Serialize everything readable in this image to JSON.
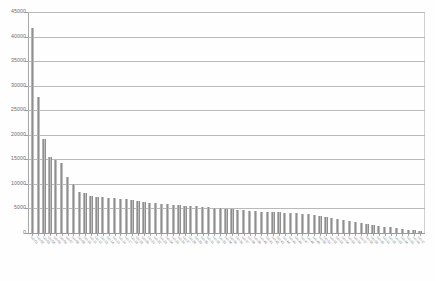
{
  "chart_data": {
    "type": "bar",
    "title": "",
    "xlabel": "",
    "ylabel": "",
    "ylim": [
      0,
      45000
    ],
    "ytick_step": 5000,
    "yticks": [
      0,
      5000,
      10000,
      15000,
      20000,
      25000,
      30000,
      35000,
      40000,
      45000
    ],
    "ytick_labels": [
      "0",
      "5000",
      "10000",
      "15000",
      "20000",
      "25000",
      "30000",
      "35000",
      "40000",
      "45000"
    ],
    "grid": true,
    "grid_axis": "y",
    "legend": false,
    "bar_color": "#8f8f8f",
    "gridline_color": "#b9b9b9",
    "axis_color": "#a8a8a8",
    "categories": [
      "cat-01",
      "cat-02",
      "cat-03",
      "cat-04",
      "cat-05",
      "cat-06",
      "cat-07",
      "cat-08",
      "cat-09",
      "cat-10",
      "cat-11",
      "cat-12",
      "cat-13",
      "cat-14",
      "cat-15",
      "cat-16",
      "cat-17",
      "cat-18",
      "cat-19",
      "cat-20",
      "cat-21",
      "cat-22",
      "cat-23",
      "cat-24",
      "cat-25",
      "cat-26",
      "cat-27",
      "cat-28",
      "cat-29",
      "cat-30",
      "cat-31",
      "cat-32",
      "cat-33",
      "cat-34",
      "cat-35",
      "cat-36",
      "cat-37",
      "cat-38",
      "cat-39",
      "cat-40",
      "cat-41",
      "cat-42",
      "cat-43",
      "cat-44",
      "cat-45",
      "cat-46",
      "cat-47",
      "cat-48",
      "cat-49",
      "cat-50",
      "cat-51",
      "cat-52",
      "cat-53",
      "cat-54",
      "cat-55",
      "cat-56",
      "cat-57",
      "cat-58",
      "cat-59",
      "cat-60",
      "cat-61",
      "cat-62",
      "cat-63",
      "cat-64",
      "cat-65",
      "cat-66",
      "cat-67"
    ],
    "values": [
      41800,
      27600,
      19100,
      15500,
      14900,
      14200,
      11400,
      10000,
      8300,
      8200,
      7500,
      7400,
      7300,
      7200,
      7100,
      7000,
      6900,
      6700,
      6500,
      6300,
      6200,
      6100,
      6000,
      5900,
      5800,
      5700,
      5600,
      5500,
      5400,
      5300,
      5200,
      5100,
      5000,
      4900,
      4800,
      4700,
      4600,
      4500,
      4400,
      4350,
      4300,
      4250,
      4200,
      4150,
      4100,
      4000,
      3900,
      3800,
      3700,
      3500,
      3300,
      3100,
      2900,
      2700,
      2500,
      2300,
      2100,
      1900,
      1700,
      1500,
      1300,
      1150,
      1000,
      850,
      700,
      520,
      330
    ],
    "note": "Long-tail descending distribution; x-axis category labels are rotated ~45 degrees and unreadable in the source scan."
  }
}
